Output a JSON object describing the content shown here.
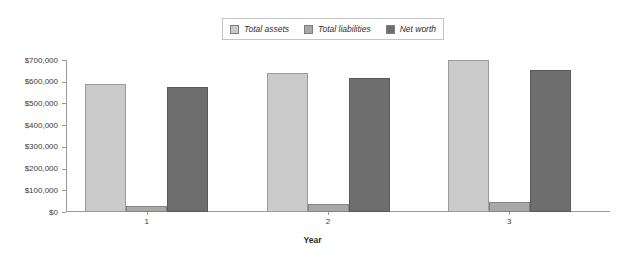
{
  "chart_data": {
    "type": "bar",
    "title": "",
    "subtitle": "",
    "xlabel": "Year",
    "ylabel": "",
    "categories": [
      "1",
      "2",
      "3"
    ],
    "series": [
      {
        "name": "Total assets",
        "values": [
          590000,
          640000,
          700000
        ],
        "color": "#cacaca"
      },
      {
        "name": "Total liabilities",
        "values": [
          28000,
          35000,
          48000
        ],
        "color": "#a8a8a8"
      },
      {
        "name": "Net worth",
        "values": [
          578000,
          617000,
          655000
        ],
        "color": "#6e6e6e"
      }
    ],
    "ylim": [
      0,
      700000
    ],
    "ytick_values": [
      0,
      100000,
      200000,
      300000,
      400000,
      500000,
      600000,
      700000
    ],
    "ytick_labels": [
      "$0",
      "$100,000",
      "$200,000",
      "$300,000",
      "$400,000",
      "$500,000",
      "$600,000",
      "$700,000"
    ],
    "grid": false,
    "legend_position": "top-center",
    "legend_entries": [
      "Total assets",
      "Total liabilities",
      "Net worth"
    ],
    "annotations": []
  }
}
